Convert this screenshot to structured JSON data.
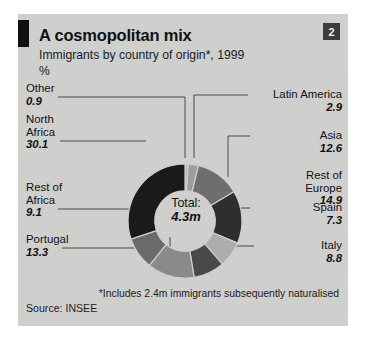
{
  "panel": {
    "badge": "2",
    "title": "A cosmopolitan mix",
    "subtitle": "Immigrants by country of origin*, 1999",
    "unit": "%",
    "footnote": "*Includes 2.4m immigrants subsequently naturalised",
    "source": "Source: INSEE",
    "center_label": "Total:",
    "center_value": "4.3m",
    "background_color": "#cfcfcd",
    "marker_color": "#111111",
    "badge_color": "#3c3c3c"
  },
  "chart_data": {
    "type": "pie",
    "title": "A cosmopolitan mix",
    "subtitle": "Immigrants by country of origin*, 1999",
    "ylabel": "%",
    "unit": "%",
    "total": "4.3m",
    "legend": "callout-labels",
    "grid": false,
    "start_angle_deg": 0,
    "direction": "clockwise",
    "donut_inner_ratio": 0.53,
    "categories": [
      "Other",
      "Latin America",
      "Asia",
      "Rest of Europe",
      "Spain",
      "Italy",
      "Portugal",
      "Rest of Africa",
      "North Africa"
    ],
    "values": [
      0.9,
      2.9,
      12.6,
      14.9,
      7.3,
      8.8,
      13.3,
      9.1,
      30.1
    ],
    "colors": [
      "#b9b9b7",
      "#9d9d9b",
      "#6e6e6e",
      "#2e2e2e",
      "#adadab",
      "#4a4a4a",
      "#8a8a8a",
      "#6a6a6a",
      "#1a1a1a"
    ],
    "slices": [
      {
        "label": "Other",
        "value": 0.9,
        "color": "#b9b9b7",
        "side": "left"
      },
      {
        "label": "Latin America",
        "value": 2.9,
        "color": "#9d9d9b",
        "side": "right"
      },
      {
        "label": "Asia",
        "value": 12.6,
        "color": "#6e6e6e",
        "side": "right"
      },
      {
        "label": "Rest of Europe",
        "value": 14.9,
        "color": "#2e2e2e",
        "side": "right"
      },
      {
        "label": "Spain",
        "value": 7.3,
        "color": "#adadab",
        "side": "right"
      },
      {
        "label": "Italy",
        "value": 8.8,
        "color": "#4a4a4a",
        "side": "right"
      },
      {
        "label": "Portugal",
        "value": 13.3,
        "color": "#8a8a8a",
        "side": "left"
      },
      {
        "label": "Rest of Africa",
        "value": 9.1,
        "color": "#6a6a6a",
        "side": "left"
      },
      {
        "label": "North Africa",
        "value": 30.1,
        "color": "#1a1a1a",
        "side": "left"
      }
    ]
  },
  "callouts": {
    "other": {
      "name": "Other",
      "value": "0.9"
    },
    "north_africa_l1": "North",
    "north_africa_l2": "Africa",
    "north_africa_value": "30.1",
    "rest_of_africa_l1": "Rest of",
    "rest_of_africa_l2": "Africa",
    "rest_of_africa_value": "9.1",
    "portugal": {
      "name": "Portugal",
      "value": "13.3"
    },
    "latin_america": {
      "name": "Latin America",
      "value": "2.9"
    },
    "asia": {
      "name": "Asia",
      "value": "12.6"
    },
    "rest_of_europe_l1": "Rest of",
    "rest_of_europe_l2": "Europe",
    "rest_of_europe_value": "14.9",
    "spain": {
      "name": "Spain",
      "value": "7.3"
    },
    "italy": {
      "name": "Italy",
      "value": "8.8"
    }
  }
}
